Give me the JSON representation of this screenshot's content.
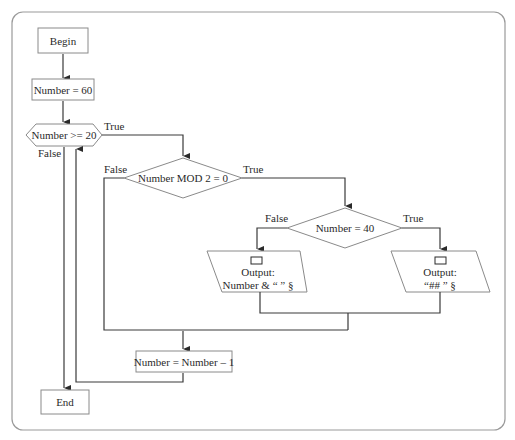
{
  "diagram": {
    "type": "flowchart",
    "nodes": {
      "begin": {
        "shape": "rectangle",
        "label": "Begin"
      },
      "init": {
        "shape": "rectangle",
        "label": "Number = 60"
      },
      "loop_cond": {
        "shape": "hexagon",
        "label": "Number >= 20"
      },
      "mod_cond": {
        "shape": "diamond",
        "label": "Number MOD 2 = 0"
      },
      "eq_cond": {
        "shape": "diamond",
        "label": "Number = 40"
      },
      "output_false": {
        "shape": "parallelogram",
        "icon": "output-icon",
        "line1": "Output:",
        "line2": "Number & “ ” §"
      },
      "output_true": {
        "shape": "parallelogram",
        "icon": "output-icon",
        "line1": "Output:",
        "line2": "“## ” §"
      },
      "decrement": {
        "shape": "rectangle",
        "label": "Number = Number – 1"
      },
      "end": {
        "shape": "rectangle",
        "label": "End"
      }
    },
    "edge_labels": {
      "loop_true": "True",
      "loop_false": "False",
      "mod_true": "True",
      "mod_false": "False",
      "eq_true": "True",
      "eq_false": "False"
    },
    "edges": [
      {
        "from": "begin",
        "to": "init"
      },
      {
        "from": "init",
        "to": "loop_cond"
      },
      {
        "from": "loop_cond",
        "to": "mod_cond",
        "label": "True"
      },
      {
        "from": "loop_cond",
        "to": "end",
        "label": "False"
      },
      {
        "from": "mod_cond",
        "to": "eq_cond",
        "label": "True"
      },
      {
        "from": "mod_cond",
        "to": "decrement",
        "label": "False"
      },
      {
        "from": "eq_cond",
        "to": "output_true",
        "label": "True"
      },
      {
        "from": "eq_cond",
        "to": "output_false",
        "label": "False"
      },
      {
        "from": "output_false",
        "to": "decrement"
      },
      {
        "from": "output_true",
        "to": "decrement"
      },
      {
        "from": "decrement",
        "to": "loop_cond"
      }
    ]
  }
}
